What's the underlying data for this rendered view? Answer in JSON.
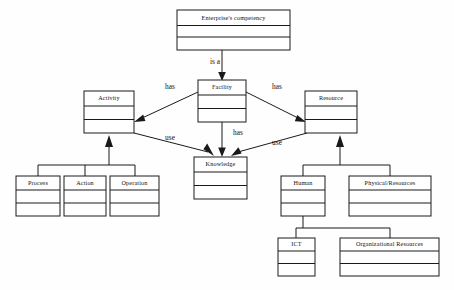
{
  "diagram": {
    "type": "uml-class-diagram",
    "nodes": [
      {
        "id": "competency",
        "label": "Enterprise's competency",
        "x": 177,
        "y": 10,
        "w": 113,
        "h": 40,
        "compartments": 3
      },
      {
        "id": "activity",
        "label": "Activity",
        "x": 84,
        "y": 91,
        "w": 50,
        "h": 42,
        "compartments": 3
      },
      {
        "id": "facility",
        "label": "Facility",
        "x": 198,
        "y": 80,
        "w": 48,
        "h": 42,
        "compartments": 3
      },
      {
        "id": "resource",
        "label": "Resource",
        "x": 305,
        "y": 91,
        "w": 52,
        "h": 42,
        "compartments": 3
      },
      {
        "id": "knowledge",
        "label": "Knowledge",
        "x": 194,
        "y": 157,
        "w": 53,
        "h": 42,
        "compartments": 3
      },
      {
        "id": "process",
        "label": "Process",
        "x": 16,
        "y": 176,
        "w": 44,
        "h": 40,
        "compartments": 3
      },
      {
        "id": "action",
        "label": "Action",
        "x": 64,
        "y": 176,
        "w": 42,
        "h": 40,
        "compartments": 3
      },
      {
        "id": "operation",
        "label": "Operation",
        "x": 110,
        "y": 176,
        "w": 49,
        "h": 40,
        "compartments": 3
      },
      {
        "id": "human",
        "label": "Human",
        "x": 281,
        "y": 176,
        "w": 44,
        "h": 40,
        "compartments": 3
      },
      {
        "id": "physical-resources",
        "label": "Physical/Resources",
        "x": 349,
        "y": 176,
        "w": 82,
        "h": 40,
        "compartments": 3
      },
      {
        "id": "ict",
        "label": "ICT",
        "x": 278,
        "y": 238,
        "w": 37,
        "h": 38,
        "compartments": 3
      },
      {
        "id": "org-resources",
        "label": "Organizational Resources",
        "x": 340,
        "y": 238,
        "w": 99,
        "h": 38,
        "compartments": 3
      }
    ],
    "edges": [
      {
        "id": "competency-facility",
        "from": "competency",
        "to": "facility",
        "label": "is a",
        "kind": "association"
      },
      {
        "id": "facility-activity",
        "from": "facility",
        "to": "activity",
        "label": "has",
        "kind": "association"
      },
      {
        "id": "facility-resource",
        "from": "facility",
        "to": "resource",
        "label": "has",
        "kind": "association"
      },
      {
        "id": "facility-knowledge",
        "from": "facility",
        "to": "knowledge",
        "label": "has",
        "kind": "association"
      },
      {
        "id": "activity-knowledge",
        "from": "activity",
        "to": "knowledge",
        "label": "use",
        "kind": "association"
      },
      {
        "id": "resource-knowledge",
        "from": "resource",
        "to": "knowledge",
        "label": "use",
        "kind": "association"
      },
      {
        "id": "activity-children",
        "from": "activity",
        "to": "process,action,operation",
        "label": "",
        "kind": "generalization"
      },
      {
        "id": "resource-children",
        "from": "resource",
        "to": "human,physical-resources",
        "label": "",
        "kind": "generalization"
      },
      {
        "id": "human-children",
        "from": "human",
        "to": "ict,org-resources",
        "label": "",
        "kind": "generalization"
      }
    ],
    "labels": {
      "is_a": "is a",
      "has_left": "has",
      "has_right": "has",
      "has_down": "has",
      "use_left": "use",
      "use_right": "use"
    },
    "colors": {
      "stroke": "#1a1a1a",
      "fill": "#ffffff",
      "background": "#fefefe",
      "text": "#111111"
    }
  }
}
